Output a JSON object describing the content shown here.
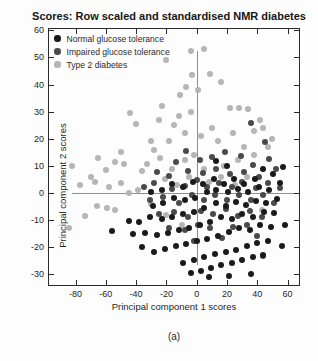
{
  "figure": {
    "caption": "(a)"
  },
  "chart_data": {
    "type": "scatter",
    "title": "Scores: Row scaled and standardised NMR diabetes",
    "xlabel": "Principal component 1 scores",
    "ylabel": "Principal component 2 scores",
    "xlim": [
      -97.5,
      67.5
    ],
    "ylim": [
      -34,
      60.5
    ],
    "xticks": [
      -80,
      -60,
      -40,
      -20,
      0,
      20,
      40,
      60
    ],
    "yticks": [
      -30,
      -20,
      -10,
      0,
      10,
      20,
      30,
      40,
      50,
      60
    ],
    "grid": false,
    "legend_position": "top-left-inside",
    "axis_color": "#2a2a2a",
    "reference_lines": {
      "color": "#8f8f8f",
      "vertical": {
        "x": 0,
        "y_from": -26.5,
        "y_to": 52.5
      },
      "horizontal": {
        "y": 0,
        "x_from": -82,
        "x_to": 67.5
      }
    },
    "marker": {
      "shape": "circle",
      "diameter_px": 6
    },
    "series": [
      {
        "name": "Normal glucose tolerance",
        "color": "#1a1a1a",
        "points": [
          [
            57,
            9.5
          ],
          [
            50.5,
            6.8
          ],
          [
            44,
            9
          ],
          [
            38.5,
            5.2
          ],
          [
            31,
            3.4
          ],
          [
            24.5,
            5
          ],
          [
            18,
            3.2
          ],
          [
            11.5,
            5.3
          ],
          [
            4,
            3.1
          ],
          [
            -2.5,
            4.2
          ],
          [
            -9,
            2.3
          ],
          [
            -16,
            3.1
          ],
          [
            -23,
            1.2
          ],
          [
            -30,
            0.4
          ],
          [
            55,
            3.8
          ],
          [
            48,
            1.2
          ],
          [
            41,
            2.3
          ],
          [
            34,
            0.2
          ],
          [
            27,
            1.4
          ],
          [
            20.5,
            0.3
          ],
          [
            13,
            1.2
          ],
          [
            6.5,
            0.4
          ],
          [
            -1,
            -1.8
          ],
          [
            -8,
            -2.6
          ],
          [
            -15,
            -1.9
          ],
          [
            -22,
            -3.6
          ],
          [
            -29,
            -4.8
          ],
          [
            53,
            -2.2
          ],
          [
            46,
            -3.8
          ],
          [
            39,
            -2.9
          ],
          [
            32.5,
            -4.6
          ],
          [
            26,
            -3.2
          ],
          [
            19,
            -4.8
          ],
          [
            12.5,
            -3.9
          ],
          [
            5,
            -5.6
          ],
          [
            -2,
            -6.9
          ],
          [
            -9,
            -7.7
          ],
          [
            -16.5,
            -8.8
          ],
          [
            -23,
            -9.6
          ],
          [
            -31,
            -8.9
          ],
          [
            -38,
            -10.8
          ],
          [
            51,
            -7.6
          ],
          [
            44.5,
            -6.9
          ],
          [
            37,
            -8.8
          ],
          [
            30,
            -7.7
          ],
          [
            23,
            -9.6
          ],
          [
            16,
            -8.9
          ],
          [
            9,
            -10.7
          ],
          [
            2,
            -11.8
          ],
          [
            -5,
            -12.9
          ],
          [
            -12,
            -13.7
          ],
          [
            -19,
            -14.8
          ],
          [
            -26,
            -15.6
          ],
          [
            -34,
            -14.9
          ],
          [
            49,
            -12.6
          ],
          [
            42,
            -11.8
          ],
          [
            35,
            -13.7
          ],
          [
            28,
            -12.9
          ],
          [
            21,
            -14.6
          ],
          [
            14,
            -15.8
          ],
          [
            7,
            -16.9
          ],
          [
            0,
            -17.7
          ],
          [
            -7,
            -18.8
          ],
          [
            -14,
            -19.6
          ],
          [
            -21,
            -20.8
          ],
          [
            -28,
            -21.7
          ],
          [
            47,
            -17.8
          ],
          [
            40,
            -18.6
          ],
          [
            33,
            -19.7
          ],
          [
            26,
            -20.9
          ],
          [
            19,
            -21.8
          ],
          [
            12,
            -22.7
          ],
          [
            5,
            -23.8
          ],
          [
            -2,
            -24.6
          ],
          [
            -9,
            -25.7
          ],
          [
            44,
            -22.9
          ],
          [
            37,
            -23.8
          ],
          [
            30,
            -24.7
          ],
          [
            23,
            -25.9
          ],
          [
            16,
            -26.8
          ],
          [
            9.5,
            -27.7
          ],
          [
            3,
            -28.9
          ],
          [
            -4,
            -29.6
          ],
          [
            36,
            -29.8
          ],
          [
            21,
            -30.7
          ],
          [
            8,
            -30.9
          ],
          [
            56,
            -19.6
          ],
          [
            -56,
            -14.2
          ],
          [
            -45,
            -10.3
          ],
          [
            -42,
            -15.1
          ],
          [
            -36,
            -19.8
          ],
          [
            13,
            11.6
          ],
          [
            20,
            9.8
          ],
          [
            58,
            -11.7
          ]
        ]
      },
      {
        "name": "Impaired glucose tolerance",
        "color": "#4a4a4a",
        "points": [
          [
            36,
            25.8
          ],
          [
            18.6,
            15.1
          ],
          [
            45,
            18.7
          ],
          [
            -7,
            15.3
          ],
          [
            2,
            12.2
          ],
          [
            -14,
            11.4
          ],
          [
            10,
            13.1
          ],
          [
            29,
            13.8
          ],
          [
            37,
            10.2
          ],
          [
            48,
            12.6
          ],
          [
            -26,
            7.8
          ],
          [
            -18,
            6.2
          ],
          [
            -6,
            8.1
          ],
          [
            4,
            7.2
          ],
          [
            13,
            8.8
          ],
          [
            22,
            6.9
          ],
          [
            31,
            7.7
          ],
          [
            41,
            5.8
          ],
          [
            52,
            8.8
          ],
          [
            -35,
            2.2
          ],
          [
            -28,
            3.8
          ],
          [
            -16,
            1.3
          ],
          [
            -8,
            2.7
          ],
          [
            0,
            4.8
          ],
          [
            7,
            2.2
          ],
          [
            15,
            3.7
          ],
          [
            23,
            2.1
          ],
          [
            30,
            3.9
          ],
          [
            39,
            1.8
          ],
          [
            47,
            3.6
          ],
          [
            55,
            1.8
          ],
          [
            -31,
            -2.8
          ],
          [
            -22,
            -1.7
          ],
          [
            -12,
            -3.8
          ],
          [
            -3,
            -0.9
          ],
          [
            5,
            -2.8
          ],
          [
            12,
            -0.8
          ],
          [
            20,
            -2.7
          ],
          [
            28,
            -0.9
          ],
          [
            36,
            -2.8
          ],
          [
            44,
            -0.8
          ],
          [
            51,
            -3.7
          ],
          [
            -25,
            -7.8
          ],
          [
            -15,
            -6.9
          ],
          [
            -6,
            -8.8
          ],
          [
            3,
            -6.7
          ],
          [
            11,
            -7.8
          ],
          [
            19,
            -5.9
          ],
          [
            27,
            -8.7
          ],
          [
            35,
            -6.8
          ],
          [
            43,
            -8.8
          ],
          [
            -18,
            -12.8
          ],
          [
            -8,
            -13.7
          ],
          [
            1,
            -11.8
          ],
          [
            9,
            -12.9
          ],
          [
            24,
            -12.7
          ],
          [
            33,
            -11.8
          ],
          [
            17,
            -16.8
          ],
          [
            -2,
            -17.7
          ],
          [
            40,
            -15.8
          ],
          [
            43.6,
            -23.3
          ]
        ]
      },
      {
        "name": "Type 2 diabetes",
        "color": "#b5b5b5",
        "points": [
          [
            5,
            53
          ],
          [
            -4,
            52.5
          ],
          [
            -20,
            49
          ],
          [
            9,
            44
          ],
          [
            -3,
            43.5
          ],
          [
            16,
            41
          ],
          [
            -7,
            39
          ],
          [
            1,
            38
          ],
          [
            -11,
            36
          ],
          [
            -23,
            32
          ],
          [
            22,
            31.5
          ],
          [
            28,
            31.5
          ],
          [
            34,
            31
          ],
          [
            -44,
            29.5
          ],
          [
            -4,
            30
          ],
          [
            -40,
            25.5
          ],
          [
            -25,
            27
          ],
          [
            -12,
            28.5
          ],
          [
            42,
            27
          ],
          [
            -30,
            19
          ],
          [
            -15,
            25
          ],
          [
            -8,
            22
          ],
          [
            3,
            21
          ],
          [
            10,
            24
          ],
          [
            24,
            22
          ],
          [
            31,
            17
          ],
          [
            14,
            19
          ],
          [
            -18,
            19
          ],
          [
            -28,
            16
          ],
          [
            -50,
            15
          ],
          [
            -65,
            13
          ],
          [
            -24,
            12.7
          ],
          [
            -8,
            12
          ],
          [
            -54,
            11.5
          ],
          [
            -33,
            10.5
          ],
          [
            -48,
            10.5
          ],
          [
            -82,
            10
          ],
          [
            -60,
            8.5
          ],
          [
            -36,
            8
          ],
          [
            5,
            9
          ],
          [
            18,
            10
          ],
          [
            27,
            12
          ],
          [
            38,
            14
          ],
          [
            47,
            17
          ],
          [
            -70,
            6
          ],
          [
            -77,
            3
          ],
          [
            -58,
            2
          ],
          [
            -67,
            4
          ],
          [
            -45,
            0
          ],
          [
            -39,
            1.1
          ],
          [
            -50,
            3.5
          ],
          [
            -21,
            5
          ],
          [
            -13,
            3
          ],
          [
            -5,
            6
          ],
          [
            8,
            4
          ],
          [
            16,
            6
          ],
          [
            -66,
            -5
          ],
          [
            -59,
            -5.5
          ],
          [
            -54,
            -6.2
          ],
          [
            -84,
            -12.9
          ],
          [
            -74,
            -8.7
          ],
          [
            -30,
            -4
          ],
          [
            -20,
            -8
          ],
          [
            -10,
            -12
          ],
          [
            25,
            3
          ],
          [
            33,
            6
          ],
          [
            -2,
            14
          ],
          [
            -16,
            9
          ],
          [
            44,
            24
          ],
          [
            50,
            20
          ],
          [
            38,
            22.7
          ],
          [
            43,
            -6.2
          ]
        ]
      }
    ]
  }
}
